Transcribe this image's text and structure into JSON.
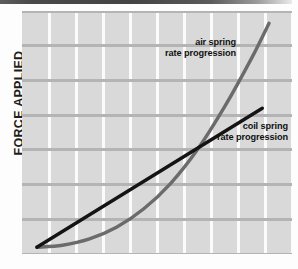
{
  "figure": {
    "background_color": "#fdfdfd",
    "top_band_color": "#4a4a4a",
    "plot_background_color": "#d9d9d9",
    "vertical_gridline_color": "#fbfbfb",
    "horizontal_gridline_color": "#b4b4b4"
  },
  "axis": {
    "y_label": "FORCE APPLIED"
  },
  "annotations": {
    "air": "air spring\nrate progression",
    "coil": "coil spring\nrate progression"
  },
  "chart_data": {
    "type": "line",
    "title": "",
    "subtitle": "",
    "xlabel": "",
    "ylabel": "FORCE APPLIED",
    "xlim": [
      0,
      10
    ],
    "ylim": [
      0,
      10
    ],
    "grid": true,
    "x_ticks": [
      0,
      1,
      2,
      3,
      4,
      5,
      6,
      7,
      8,
      9,
      10
    ],
    "x_tick_labels": [],
    "y_ticks": [
      0,
      1.43,
      2.86,
      4.29,
      5.71,
      7.14,
      8.57,
      10
    ],
    "y_tick_labels": [],
    "legend_position": "inline-annotations",
    "annotations": [
      {
        "text": "air spring\nrate progression",
        "series": "air spring rate progression",
        "x": 7.3,
        "y": 8.6
      },
      {
        "text": "coil spring\nrate progression",
        "series": "coil spring rate progression",
        "x": 9.2,
        "y": 5.1
      }
    ],
    "series": [
      {
        "name": "coil spring rate progression",
        "style": "straight",
        "color": "#141414",
        "linewidth": 3.4,
        "x": [
          0.55,
          1.5,
          2.5,
          3.5,
          4.5,
          5.5,
          6.5,
          7.5,
          8.5,
          8.9
        ],
        "values": [
          0.28,
          0.93,
          1.61,
          2.3,
          2.99,
          3.67,
          4.36,
          5.05,
          5.73,
          6.0
        ]
      },
      {
        "name": "air spring rate progression",
        "style": "progressive-curve",
        "color": "#6b6b6b",
        "linewidth": 3.4,
        "x": [
          0.55,
          1.5,
          2.5,
          3.5,
          4.5,
          5.5,
          6.5,
          7.5,
          8.5,
          9.15
        ],
        "values": [
          0.28,
          0.36,
          0.62,
          1.1,
          1.85,
          2.9,
          4.3,
          6.05,
          8.05,
          9.5
        ]
      }
    ],
    "intersection": {
      "x": 6.23,
      "y": 4.16
    }
  }
}
